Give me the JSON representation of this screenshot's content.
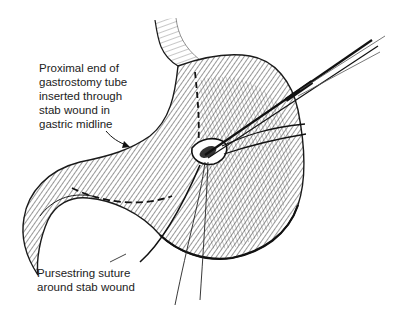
{
  "figure": {
    "style": "black-and-white pen line illustration",
    "colors": {
      "ink": "#1a1a1a",
      "background": "#ffffff"
    }
  },
  "labels": {
    "tube": {
      "lines": [
        "Proximal end of",
        "gastrostomy tube",
        "inserted through",
        "stab wound in",
        "gastric midline"
      ]
    },
    "suture": {
      "lines": [
        "Pursestring suture",
        "around stab wound"
      ]
    }
  },
  "caption": {
    "text": "",
    "note": "bottom caption line cropped off at image edge"
  }
}
